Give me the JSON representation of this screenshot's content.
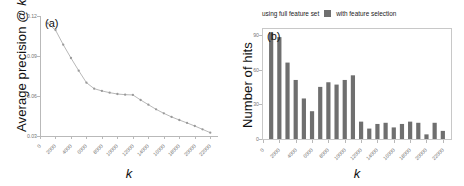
{
  "figure": {
    "panels": [
      "a",
      "b"
    ]
  },
  "panel_a": {
    "tag": "(a)",
    "ylabel_text": "Average precision @ ",
    "ylabel_italic": "k",
    "xlabel": "k",
    "legend": [
      {
        "key": "none",
        "label": "using full feature set"
      },
      {
        "key": "line-marker",
        "label": "with feature selection"
      }
    ],
    "colors": {
      "line": "#b0b0b0",
      "marker": "#9a9a9a",
      "axis": "#b9b9b9",
      "tick_text": "#777777"
    }
  },
  "panel_b": {
    "tag": "(b)",
    "ylabel": "Number of hits",
    "xlabel": "k",
    "legend": [
      {
        "key": "none",
        "label": "using full feature set"
      },
      {
        "key": "swatch",
        "label": "with feature selection"
      }
    ],
    "colors": {
      "bar": "#6f6f6f",
      "frame": "#c8c8c8",
      "tick_text": "#777777"
    }
  },
  "chart_data": [
    {
      "type": "line",
      "title": "(a)",
      "xlabel": "k",
      "ylabel": "Average precision @ k",
      "xlim": [
        0,
        23000
      ],
      "ylim": [
        0.03,
        0.12
      ],
      "xticks": [
        0,
        2000,
        4000,
        6000,
        8000,
        10000,
        12000,
        14000,
        16000,
        18000,
        20000,
        22000
      ],
      "xticklabels": [
        "0",
        "2000",
        "4000",
        "6000",
        "8000",
        "10000",
        "12000",
        "14000",
        "16000",
        "18000",
        "20000",
        "22000"
      ],
      "yticks": [
        0.03,
        0.06,
        0.09,
        0.12
      ],
      "yticklabels": [
        "0.03",
        "0.06",
        "0.09",
        "0.12"
      ],
      "grid": false,
      "legend_position": "top-right",
      "series": [
        {
          "name": "with feature selection",
          "x": [
            1000,
            2000,
            3000,
            4000,
            5000,
            6000,
            7000,
            8000,
            9000,
            10000,
            11000,
            12000,
            13000,
            14000,
            15000,
            16000,
            17000,
            18000,
            19000,
            20000,
            21000,
            22000
          ],
          "values": [
            0.1145,
            0.1095,
            0.0985,
            0.0885,
            0.079,
            0.07,
            0.0655,
            0.0638,
            0.0625,
            0.0615,
            0.061,
            0.0608,
            0.057,
            0.0535,
            0.05,
            0.047,
            0.0443,
            0.042,
            0.0398,
            0.0375,
            0.035,
            0.0325
          ]
        }
      ]
    },
    {
      "type": "bar",
      "title": "(b)",
      "xlabel": "k",
      "ylabel": "Number of hits",
      "xlim": [
        0,
        23000
      ],
      "ylim": [
        0,
        95
      ],
      "xticks": [
        0,
        2000,
        4000,
        6000,
        8000,
        10000,
        12000,
        14000,
        16000,
        18000,
        20000,
        22000
      ],
      "xticklabels": [
        "0",
        "2000",
        "4000",
        "6000",
        "8000",
        "10000",
        "12000",
        "14000",
        "16000",
        "18000",
        "20000",
        "22000"
      ],
      "yticks": [
        0,
        30,
        60,
        90
      ],
      "yticklabels": [
        "0",
        "30",
        "60",
        "90"
      ],
      "grid": false,
      "legend_position": "top",
      "categories": [
        1000,
        2000,
        3000,
        4000,
        5000,
        6000,
        7000,
        8000,
        9000,
        10000,
        11000,
        12000,
        13000,
        14000,
        15000,
        16000,
        17000,
        18000,
        19000,
        20000,
        21000,
        22000
      ],
      "series": [
        {
          "name": "with feature selection",
          "values": [
            92,
            88,
            66,
            51,
            35,
            24,
            45,
            49,
            47,
            51,
            55,
            15,
            9,
            13,
            14,
            10,
            13,
            15,
            14,
            4,
            14,
            7
          ]
        }
      ]
    }
  ]
}
